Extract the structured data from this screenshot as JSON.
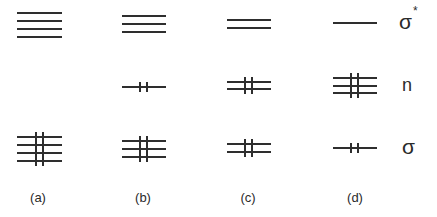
{
  "diagram": {
    "type": "molecular-orbital-occupancy-diagram",
    "stroke_color": "#2e2e2e",
    "levels": [
      {
        "id": "sigma-star",
        "label": "σ",
        "superscript": "*"
      },
      {
        "id": "n",
        "label": "n",
        "superscript": ""
      },
      {
        "id": "sigma",
        "label": "σ",
        "superscript": ""
      }
    ],
    "columns": [
      {
        "label": "(a)",
        "sigma_star": {
          "lines": 4,
          "filled": false
        },
        "n": {
          "lines": 0,
          "filled": false
        },
        "sigma": {
          "lines": 4,
          "filled": true
        }
      },
      {
        "label": "(b)",
        "sigma_star": {
          "lines": 3,
          "filled": false
        },
        "n": {
          "lines": 1,
          "filled": true
        },
        "sigma": {
          "lines": 3,
          "filled": true
        }
      },
      {
        "label": "(c)",
        "sigma_star": {
          "lines": 2,
          "filled": false
        },
        "n": {
          "lines": 2,
          "filled": true
        },
        "sigma": {
          "lines": 2,
          "filled": true
        }
      },
      {
        "label": "(d)",
        "sigma_star": {
          "lines": 1,
          "filled": false
        },
        "n": {
          "lines": 3,
          "filled": true
        },
        "sigma": {
          "lines": 1,
          "filled": true
        }
      }
    ]
  },
  "labels": {
    "sigma_star": "σ",
    "sigma_star_sup": "*",
    "n": "n",
    "sigma": "σ",
    "col_a": "(a)",
    "col_b": "(b)",
    "col_c": "(c)",
    "col_d": "(d)"
  }
}
